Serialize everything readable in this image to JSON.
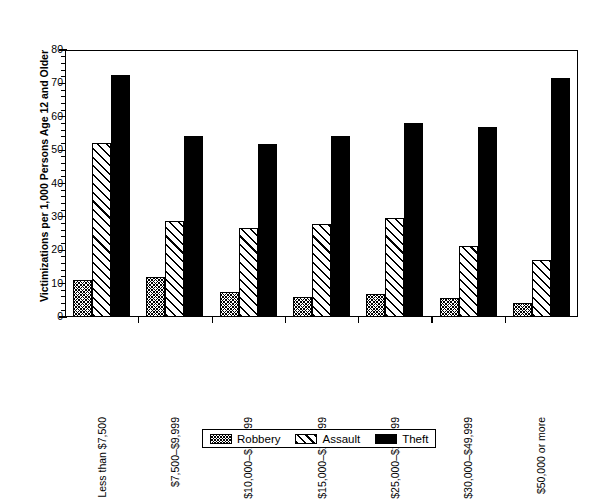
{
  "chart_data": {
    "type": "bar",
    "title": "",
    "xlabel": "",
    "ylabel": "Victimizations per 1,000 Persons Age 12 and Older",
    "ylim": [
      0,
      80
    ],
    "yticks": [
      0,
      10,
      20,
      30,
      40,
      50,
      60,
      70,
      80
    ],
    "grid": false,
    "legend_position": "bottom",
    "categories": [
      "Less than $7,500",
      "$7,500–$9,999",
      "$10,000–$14,999",
      "$15,000–$24,999",
      "$25,000–$29,999",
      "$30,000–$49,999",
      "$50,000 or more"
    ],
    "series": [
      {
        "name": "Robbery",
        "pattern": "dense-crosshatch",
        "color": "#000000",
        "values": [
          11.2,
          12.0,
          7.4,
          6.0,
          6.8,
          5.6,
          4.2
        ]
      },
      {
        "name": "Assault",
        "pattern": "diagonal-hatch",
        "color": "#000000",
        "values": [
          52.0,
          28.8,
          26.6,
          27.8,
          29.6,
          21.2,
          17.2
        ]
      },
      {
        "name": "Theft",
        "pattern": "solid",
        "color": "#000000",
        "values": [
          72.6,
          54.2,
          51.8,
          54.2,
          58.0,
          57.0,
          71.6
        ]
      }
    ]
  },
  "legend": {
    "items": [
      {
        "label": "Robbery",
        "pattern": "dense-crosshatch"
      },
      {
        "label": "Assault",
        "pattern": "diagonal-hatch"
      },
      {
        "label": "Theft",
        "pattern": "solid"
      }
    ]
  }
}
